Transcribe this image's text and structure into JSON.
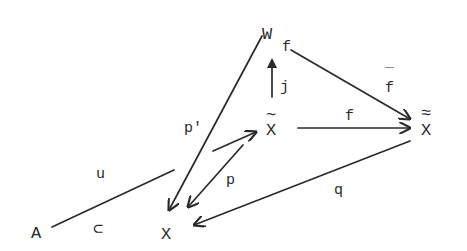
{
  "diagram": {
    "type": "commutative-diagram",
    "nodes": {
      "W": {
        "label": "W",
        "subscript": "f"
      },
      "Xtilde": {
        "label": "X",
        "accent": "~"
      },
      "Xdtilde": {
        "label": "X",
        "accent": "≈"
      },
      "A": {
        "label": "A"
      },
      "X": {
        "label": "X"
      }
    },
    "edges": [
      {
        "id": "j",
        "from": "Xtilde",
        "to": "W",
        "label": "j"
      },
      {
        "id": "fbar",
        "from": "W",
        "to": "Xdtilde",
        "label": "f̄",
        "label_base": "f",
        "label_accent": "‾"
      },
      {
        "id": "f",
        "from": "Xtilde",
        "to": "Xdtilde",
        "label": "f"
      },
      {
        "id": "p_prime",
        "from": "W",
        "to": "X",
        "label": "p'"
      },
      {
        "id": "p",
        "from": "Xtilde",
        "to": "X",
        "label": "p"
      },
      {
        "id": "lift",
        "from": "A",
        "to": "Xtilde",
        "label": "u"
      },
      {
        "id": "q",
        "from": "Xdtilde",
        "to": "X",
        "label": "q"
      },
      {
        "id": "incl",
        "from": "A",
        "to": "X",
        "label": "⊂"
      }
    ],
    "colors": {
      "ink": "#2a2a2a",
      "background": "#ffffff"
    }
  }
}
